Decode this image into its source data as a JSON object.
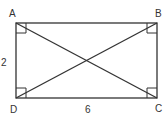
{
  "figure": {
    "shape": "rectangle",
    "vertices": {
      "A": {
        "label": "A"
      },
      "B": {
        "label": "B"
      },
      "C": {
        "label": "C"
      },
      "D": {
        "label": "D"
      }
    },
    "side_labels": {
      "AD": "2",
      "DC": "6"
    },
    "diagonals": [
      "AC",
      "BD"
    ],
    "right_angle_marks": [
      "A",
      "B",
      "C",
      "D"
    ],
    "stroke_color": "#333333"
  }
}
